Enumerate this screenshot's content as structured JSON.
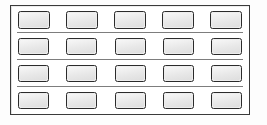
{
  "figure": {
    "name": "panel-grid",
    "background_color": "#ffffff",
    "frame": {
      "border_color": "#3a3a3a",
      "fill_color": "#ffffff",
      "border_width_px": 1.5
    },
    "cell": {
      "border_color": "#2b2b2b",
      "fill_color": "#ededed",
      "corner_radius_px": 2.5
    },
    "divider": {
      "color": "#7d7d7d",
      "thickness_px": 1,
      "count": 3
    },
    "grid": {
      "rows": 4,
      "columns": 5,
      "total_cells": 20
    },
    "rows": [
      {
        "id": "row-1",
        "cells": [
          {
            "id": "cell-r1c1",
            "label": ""
          },
          {
            "id": "cell-r1c2",
            "label": ""
          },
          {
            "id": "cell-r1c3",
            "label": ""
          },
          {
            "id": "cell-r1c4",
            "label": ""
          },
          {
            "id": "cell-r1c5",
            "label": ""
          }
        ]
      },
      {
        "id": "row-2",
        "cells": [
          {
            "id": "cell-r2c1",
            "label": ""
          },
          {
            "id": "cell-r2c2",
            "label": ""
          },
          {
            "id": "cell-r2c3",
            "label": ""
          },
          {
            "id": "cell-r2c4",
            "label": ""
          },
          {
            "id": "cell-r2c5",
            "label": ""
          }
        ]
      },
      {
        "id": "row-3",
        "cells": [
          {
            "id": "cell-r3c1",
            "label": ""
          },
          {
            "id": "cell-r3c2",
            "label": ""
          },
          {
            "id": "cell-r3c3",
            "label": ""
          },
          {
            "id": "cell-r3c4",
            "label": ""
          },
          {
            "id": "cell-r3c5",
            "label": ""
          }
        ]
      },
      {
        "id": "row-4",
        "cells": [
          {
            "id": "cell-r4c1",
            "label": ""
          },
          {
            "id": "cell-r4c2",
            "label": ""
          },
          {
            "id": "cell-r4c3",
            "label": ""
          },
          {
            "id": "cell-r4c4",
            "label": ""
          },
          {
            "id": "cell-r4c5",
            "label": ""
          }
        ]
      }
    ]
  }
}
